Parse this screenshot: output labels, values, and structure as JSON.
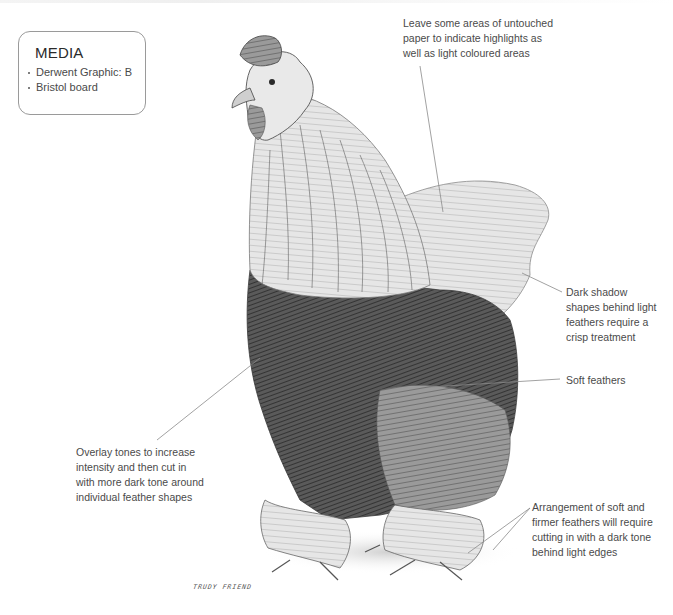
{
  "media_box": {
    "title": "MEDIA",
    "items": [
      "Derwent Graphic: B",
      "Bristol board"
    ]
  },
  "annotations": {
    "highlights": "Leave some areas of untouched\npaper to indicate highlights as\nwell as light coloured areas",
    "dark_shadow": "Dark shadow\nshapes behind light\nfeathers require a\ncrisp treatment",
    "soft_feathers": "Soft feathers",
    "overlay_tones": "Overlay tones to increase\nintensity and then cut in\nwith more dark tone around\nindividual feather shapes",
    "arrangement": "Arrangement of soft and\nfirmer feathers will require\ncutting in with a dark tone\nbehind light edges"
  },
  "illustration": {
    "subject": "rooster-pencil-drawing",
    "signature": "TRUDY FRIEND"
  },
  "colors": {
    "background": "#ffffff",
    "text": "#4a4a4a",
    "leader_line": "#8a8a8a",
    "box_border": "#9a9a9a",
    "pencil_dark": "#2b2b2b",
    "pencil_mid": "#6e6e6e",
    "pencil_light": "#b8b8b8"
  }
}
